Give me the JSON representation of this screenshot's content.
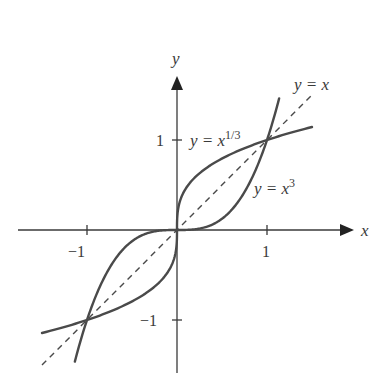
{
  "figure": {
    "axes": {
      "x_label": "x",
      "y_label": "y",
      "x_ticks": [
        {
          "value": -1,
          "label": "−1"
        },
        {
          "value": 1,
          "label": "1"
        }
      ],
      "y_ticks": [
        {
          "value": 1,
          "label": "1"
        },
        {
          "value": -1,
          "label": "−1"
        }
      ]
    },
    "curves": [
      {
        "id": "cube-root",
        "label_lhs": "y = x",
        "label_exp": "1/3",
        "style": "solid"
      },
      {
        "id": "cube",
        "label_lhs": "y = x",
        "label_exp": "3",
        "style": "solid"
      },
      {
        "id": "identity",
        "label": "y = x",
        "style": "dashed"
      }
    ],
    "colors": {
      "curve": "#4a4a4a",
      "axis": "#3a3a3a",
      "text": "#3a3a3a",
      "background": "#ffffff"
    },
    "intersections": [
      [
        -1,
        -1
      ],
      [
        0,
        0
      ],
      [
        1,
        1
      ]
    ]
  }
}
